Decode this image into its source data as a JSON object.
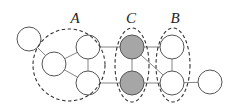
{
  "diagram": {
    "type": "graph",
    "colors": {
      "node_fill": "#ffffff",
      "highlight_fill": "#a6a6a6",
      "node_stroke": "#555555",
      "group_stroke": "#333333"
    },
    "groups": [
      {
        "id": "A",
        "label": "A",
        "shape": "circle",
        "cx": 69,
        "cy": 65,
        "rx": 36,
        "ry": 36,
        "label_x": 75,
        "label_y": 23
      },
      {
        "id": "C",
        "label": "C",
        "shape": "ellipse",
        "cx": 132,
        "cy": 65,
        "rx": 17,
        "ry": 37,
        "label_x": 131,
        "label_y": 23
      },
      {
        "id": "B",
        "label": "B",
        "shape": "ellipse",
        "cx": 173,
        "cy": 65,
        "rx": 17,
        "ry": 37,
        "label_x": 175,
        "label_y": 23
      }
    ],
    "nodes": [
      {
        "id": "n0",
        "cx": 29,
        "cy": 39,
        "r": 12,
        "group": null,
        "highlighted": false
      },
      {
        "id": "a1",
        "cx": 54,
        "cy": 64,
        "r": 12,
        "group": "A",
        "highlighted": false
      },
      {
        "id": "a2",
        "cx": 88,
        "cy": 47,
        "r": 12,
        "group": "A",
        "highlighted": false
      },
      {
        "id": "a3",
        "cx": 88,
        "cy": 83,
        "r": 12,
        "group": "A",
        "highlighted": false
      },
      {
        "id": "c1",
        "cx": 132,
        "cy": 47,
        "r": 12,
        "group": "C",
        "highlighted": true
      },
      {
        "id": "c2",
        "cx": 132,
        "cy": 83,
        "r": 12,
        "group": "C",
        "highlighted": true
      },
      {
        "id": "b1",
        "cx": 172,
        "cy": 47,
        "r": 12,
        "group": "B",
        "highlighted": false
      },
      {
        "id": "b2",
        "cx": 172,
        "cy": 83,
        "r": 12,
        "group": "B",
        "highlighted": false
      },
      {
        "id": "n9",
        "cx": 210,
        "cy": 82,
        "r": 12,
        "group": null,
        "highlighted": false
      }
    ],
    "edges": [
      [
        "n0",
        "a1"
      ],
      [
        "a1",
        "a2"
      ],
      [
        "a1",
        "a3"
      ],
      [
        "a2",
        "a3"
      ],
      [
        "a2",
        "c1"
      ],
      [
        "a3",
        "c2"
      ],
      [
        "c1",
        "c2"
      ],
      [
        "c1",
        "b1"
      ],
      [
        "c2",
        "b2"
      ],
      [
        "c1",
        "b2"
      ],
      [
        "b1",
        "b2"
      ],
      [
        "b2",
        "n9"
      ]
    ]
  }
}
